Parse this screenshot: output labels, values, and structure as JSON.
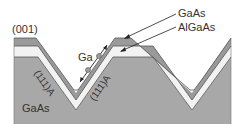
{
  "diagram": {
    "orientation_label": "(001)",
    "substrate_label": "GaAs",
    "adatom_label": "Ga",
    "facet_labels": [
      "(111)A",
      "(111)A"
    ],
    "layer_labels": [
      "GaAs",
      "AlGaAs"
    ]
  },
  "colors": {
    "substrate": "#a8a8a8",
    "algaas": "#f2f2f2",
    "gaas_top": "#9a9a9a",
    "outline": "#555555",
    "adatom": "#9a9a9a",
    "text": "#333333"
  }
}
